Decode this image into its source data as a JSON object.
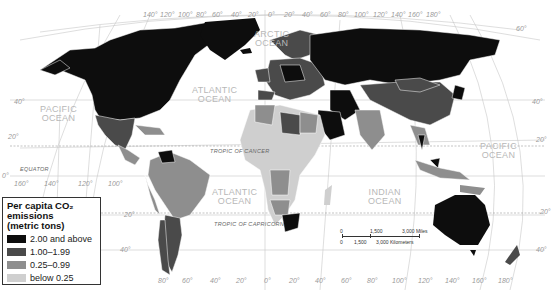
{
  "legend": {
    "title": "Per capita CO₂ emissions",
    "subtitle": "(metric tons)",
    "items": [
      {
        "label": "2.00 and above",
        "color": "#0d0d0d"
      },
      {
        "label": "1.00–1.99",
        "color": "#4a4a4a"
      },
      {
        "label": "0.25–0.99",
        "color": "#8e8e8e"
      },
      {
        "label": "below 0.25",
        "color": "#cfcfcf"
      }
    ]
  },
  "oceans": {
    "pacific_north": "PACIFIC\nOCEAN",
    "pacific_east": "PACIFIC\nOCEAN",
    "atlantic_north": "ATLANTIC\nOCEAN",
    "atlantic_south": "ATLANTIC\nOCEAN",
    "indian": "INDIAN\nOCEAN",
    "arctic": "ARCTIC\nOCEAN"
  },
  "reference_lines": {
    "equator": "EQUATOR",
    "tropic_cancer": "TROPIC OF CANCER",
    "tropic_capricorn": "TROPIC OF CAPRICORN"
  },
  "latitude_labels": {
    "left": [
      "40°",
      "20°",
      "0°",
      "20°",
      "40°"
    ],
    "right": [
      "60°",
      "40°",
      "20°",
      "20°",
      "40°"
    ]
  },
  "longitude_labels": {
    "top": [
      "140°",
      "120°",
      "100°",
      "80°",
      "60°",
      "40°",
      "20°",
      "0°",
      "20°",
      "40°",
      "60°",
      "80°",
      "100°",
      "120°",
      "140°",
      "160°",
      "180°"
    ],
    "mid": [
      "160°",
      "140°",
      "120°",
      "100°"
    ],
    "bottom": [
      "80°",
      "60°",
      "40°",
      "20°",
      "0°",
      "20°",
      "40°",
      "60°",
      "80°",
      "100°",
      "120°",
      "140°",
      "160°",
      "180°"
    ]
  },
  "scale_bar": {
    "miles_zero": "0",
    "miles_mid": "1,500",
    "miles_end": "3,000 Miles",
    "km_zero": "0",
    "km_mid": "1,500",
    "km_end": "3,000 Kilometers"
  }
}
